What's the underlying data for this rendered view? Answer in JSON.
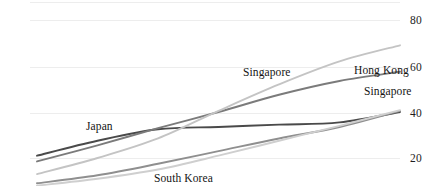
{
  "chart_data": {
    "type": "line",
    "title": "",
    "xlabel": "",
    "ylabel": "",
    "ylim": [
      10,
      90
    ],
    "yticks": [
      20,
      40,
      60,
      80
    ],
    "ytick_labels": [
      "20",
      "40",
      "60",
      "80"
    ],
    "grid": true,
    "grid_axis": "y",
    "legend_position": "inline-labels",
    "x": [
      0,
      1,
      2,
      3,
      4,
      5,
      6
    ],
    "series": [
      {
        "name": "Japan",
        "color": "#4a4a4a",
        "values": [
          21.0,
          27.5,
          32.5,
          33.5,
          34.5,
          35.5,
          40.0
        ]
      },
      {
        "name": "Hong Kong",
        "color": "#7b7b7b",
        "values": [
          18.5,
          25.5,
          33.0,
          40.0,
          47.5,
          53.5,
          57.5
        ]
      },
      {
        "name": "Singapore",
        "color": "#c4c4c4",
        "values": [
          13.0,
          20.0,
          28.5,
          40.5,
          52.0,
          62.0,
          69.0
        ]
      },
      {
        "name": "South Korea",
        "color": "#8f8f8f",
        "values": [
          9.0,
          12.5,
          17.5,
          23.0,
          28.5,
          33.5,
          40.5
        ]
      },
      {
        "name": "Singapore",
        "color": "#cfcfcf",
        "values": [
          8.0,
          11.0,
          15.0,
          21.0,
          27.5,
          34.0,
          40.8
        ]
      }
    ],
    "annotations": [
      {
        "text": "Singapore",
        "x_px": 243,
        "y_px": 66
      },
      {
        "text": "Hong Kong",
        "x_px": 354,
        "y_px": 64
      },
      {
        "text": "Singapore",
        "x_px": 364,
        "y_px": 85
      },
      {
        "text": "Japan",
        "x_px": 86,
        "y_px": 120
      },
      {
        "text": "South Korea",
        "x_px": 154,
        "y_px": 172
      }
    ]
  },
  "axis": {
    "ticks": [
      {
        "label": "80",
        "y_px": 14
      },
      {
        "label": "60",
        "y_px": 61
      },
      {
        "label": "40",
        "y_px": 107
      },
      {
        "label": "20",
        "y_px": 152
      }
    ],
    "label_x_px": 410
  },
  "grid": {
    "color": "#ededed",
    "lines_y_px": [
      2,
      20,
      67,
      113,
      158
    ],
    "x_start_px": 30,
    "x_end_px": 400
  },
  "colors": {
    "background": "#ffffff",
    "text": "#1a1a1a",
    "gridline": "#ededed",
    "japan": "#4a4a4a",
    "hong_kong": "#7b7b7b",
    "singapore_upper": "#c4c4c4",
    "south_korea": "#8f8f8f",
    "singapore_lower": "#cfcfcf"
  }
}
